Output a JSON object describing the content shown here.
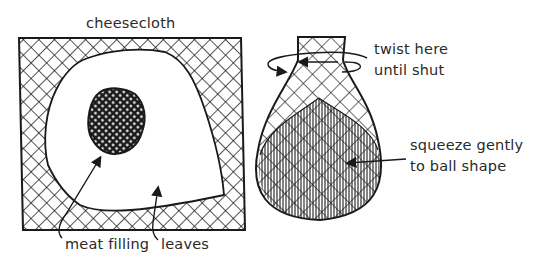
{
  "diagram": {
    "left_panel": {
      "title_label": "cheesecloth",
      "labels": {
        "meat_filling": "meat filling",
        "leaves": "leaves"
      }
    },
    "right_panel": {
      "labels": {
        "twist_line1": "twist here",
        "twist_line2": "until shut",
        "squeeze_line1": "squeeze gently",
        "squeeze_line2": "to ball shape"
      }
    },
    "colors": {
      "ink": "#1a1a1a",
      "background": "#ffffff"
    }
  }
}
